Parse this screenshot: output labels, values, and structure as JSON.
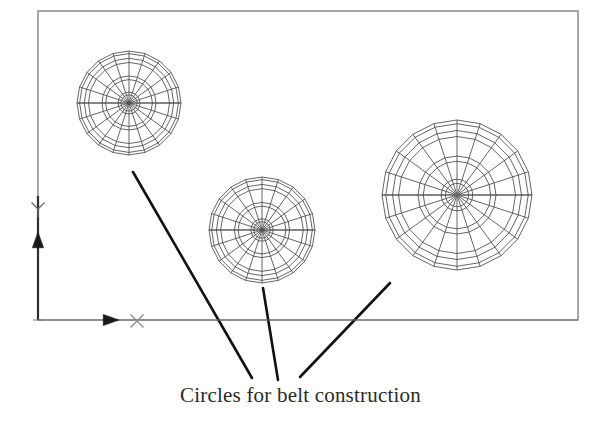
{
  "drawing": {
    "title": "Circles for belt construction",
    "background_color": "#ffffff",
    "frame": {
      "name": "drawing-border",
      "x": 38,
      "y": 11,
      "width": 540,
      "height": 309,
      "stroke": "#6e6e6e",
      "stroke_width": 1.2
    },
    "axes": {
      "origin": {
        "x": 38,
        "y": 320
      },
      "stroke": "#3a3a3a",
      "x_axis": {
        "label": "X",
        "label_x": 137,
        "label_y": 321,
        "line_from_x": 38,
        "line_to_x": 578,
        "line_y": 320,
        "arrow_x": 110,
        "arrow_y": 320,
        "arrow_size": 9,
        "stroke": "#777777"
      },
      "y_axis": {
        "label": "Y",
        "label_x": 38,
        "label_y": 209,
        "line_from_y": 320,
        "line_to_y": 196,
        "line_x": 38,
        "arrow_x": 38,
        "arrow_y": 241,
        "arrow_size": 9,
        "stroke": "#2f2f2f"
      }
    },
    "circles": [
      {
        "name": "belt-circle-left",
        "cx": 129,
        "cy": 103,
        "radius": 52,
        "spokes": 20,
        "ring_fractions": [
          0.155,
          0.21,
          0.45,
          0.52,
          0.78,
          0.86,
          0.95,
          1.0
        ],
        "stroke": "#4a4a4a",
        "stroke_width": 0.85
      },
      {
        "name": "belt-circle-middle",
        "cx": 262,
        "cy": 230,
        "radius": 53,
        "spokes": 20,
        "ring_fractions": [
          0.155,
          0.21,
          0.45,
          0.52,
          0.78,
          0.86,
          0.95,
          1.0
        ],
        "stroke": "#4a4a4a",
        "stroke_width": 0.85
      },
      {
        "name": "belt-circle-right",
        "cx": 457,
        "cy": 195,
        "radius": 75,
        "spokes": 20,
        "ring_fractions": [
          0.155,
          0.21,
          0.45,
          0.52,
          0.78,
          0.86,
          0.95,
          1.0
        ],
        "stroke": "#4a4a4a",
        "stroke_width": 0.85
      }
    ],
    "leader_lines": [
      {
        "name": "leader-line-left",
        "x1": 133,
        "y1": 172,
        "x2": 252,
        "y2": 378
      },
      {
        "name": "leader-line-middle",
        "x1": 263,
        "y1": 288,
        "x2": 278,
        "y2": 380
      },
      {
        "name": "leader-line-right",
        "x1": 390,
        "y1": 283,
        "x2": 300,
        "y2": 377
      }
    ],
    "leader_stroke": "#111111",
    "leader_width": 2.6
  }
}
